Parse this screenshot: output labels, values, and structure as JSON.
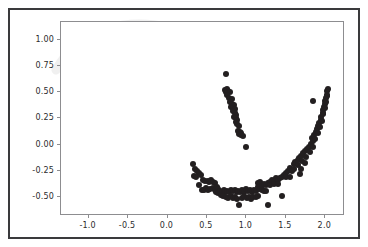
{
  "figure": {
    "background_color": "#ffffff",
    "border_color": "#3a3a3c",
    "axes_edge_color": "#8d8d90",
    "point_color": "#231f20",
    "tick_label_color": "#2b2b2d"
  },
  "chart_data": {
    "type": "scatter",
    "title": "",
    "xlabel": "",
    "ylabel": "",
    "xlim": [
      -1.35,
      2.25
    ],
    "ylim": [
      -0.68,
      1.17
    ],
    "xticks": [
      -1.0,
      -0.5,
      0.0,
      0.5,
      1.0,
      1.5,
      2.0
    ],
    "xtick_labels": [
      "-1.0",
      "-0.5",
      "0.0",
      "0.5",
      "1.0",
      "1.5",
      "2.0"
    ],
    "yticks": [
      1.0,
      0.75,
      0.5,
      0.25,
      0.0,
      -0.25,
      -0.5
    ],
    "ytick_labels": [
      "1.00",
      "0.75",
      "0.50",
      "0.25",
      "0.00",
      "-0.25",
      "-0.50"
    ],
    "grid": false,
    "legend": null,
    "marker": "circle",
    "marker_size": 6,
    "series": [
      {
        "name": "lower-moon",
        "color": "#231f20",
        "points": [
          [
            0.745,
            0.672
          ],
          [
            0.726,
            0.525
          ],
          [
            0.751,
            0.528
          ],
          [
            0.772,
            0.512
          ],
          [
            0.742,
            0.498
          ],
          [
            0.793,
            0.498
          ],
          [
            0.76,
            0.47
          ],
          [
            0.785,
            0.447
          ],
          [
            0.812,
            0.432
          ],
          [
            0.793,
            0.405
          ],
          [
            0.818,
            0.392
          ],
          [
            0.84,
            0.378
          ],
          [
            0.808,
            0.362
          ],
          [
            0.832,
            0.352
          ],
          [
            0.855,
            0.338
          ],
          [
            0.826,
            0.318
          ],
          [
            0.852,
            0.3
          ],
          [
            0.872,
            0.285
          ],
          [
            0.845,
            0.268
          ],
          [
            0.868,
            0.252
          ],
          [
            0.88,
            0.232
          ],
          [
            0.862,
            0.215
          ],
          [
            0.885,
            0.198
          ],
          [
            0.9,
            0.178
          ],
          [
            0.893,
            0.128
          ],
          [
            0.915,
            0.12
          ],
          [
            0.935,
            0.112
          ],
          [
            0.905,
            0.098
          ],
          [
            0.928,
            0.09
          ],
          [
            0.952,
            0.082
          ],
          [
            0.995,
            -0.022
          ],
          [
            0.318,
            -0.188
          ],
          [
            0.352,
            -0.228
          ],
          [
            0.372,
            -0.252
          ],
          [
            0.395,
            -0.268
          ],
          [
            0.338,
            -0.295
          ],
          [
            0.362,
            -0.305
          ],
          [
            0.42,
            -0.292
          ],
          [
            0.455,
            -0.338
          ],
          [
            0.478,
            -0.348
          ],
          [
            0.508,
            -0.345
          ],
          [
            0.53,
            -0.352
          ],
          [
            0.398,
            -0.382
          ],
          [
            0.555,
            -0.338
          ],
          [
            0.578,
            -0.355
          ],
          [
            0.6,
            -0.362
          ],
          [
            0.432,
            -0.428
          ],
          [
            0.46,
            -0.432
          ],
          [
            0.49,
            -0.415
          ],
          [
            0.515,
            -0.432
          ],
          [
            0.545,
            -0.422
          ],
          [
            0.572,
            -0.412
          ],
          [
            0.598,
            -0.432
          ],
          [
            0.622,
            -0.408
          ],
          [
            0.645,
            -0.425
          ],
          [
            0.612,
            -0.455
          ],
          [
            0.638,
            -0.462
          ],
          [
            0.665,
            -0.438
          ],
          [
            0.69,
            -0.448
          ],
          [
            0.712,
            -0.43
          ],
          [
            0.735,
            -0.452
          ],
          [
            0.672,
            -0.478
          ],
          [
            0.7,
            -0.492
          ],
          [
            0.758,
            -0.438
          ],
          [
            0.782,
            -0.452
          ],
          [
            0.805,
            -0.432
          ],
          [
            0.828,
            -0.445
          ],
          [
            0.852,
            -0.428
          ],
          [
            0.745,
            -0.495
          ],
          [
            0.772,
            -0.505
          ],
          [
            0.8,
            -0.488
          ],
          [
            0.875,
            -0.452
          ],
          [
            0.898,
            -0.438
          ],
          [
            0.922,
            -0.455
          ],
          [
            0.828,
            -0.512
          ],
          [
            0.855,
            -0.498
          ],
          [
            0.885,
            -0.518
          ],
          [
            0.908,
            -0.572
          ],
          [
            0.948,
            -0.432
          ],
          [
            0.972,
            -0.448
          ],
          [
            0.998,
            -0.425
          ],
          [
            1.022,
            -0.442
          ],
          [
            1.048,
            -0.428
          ],
          [
            0.945,
            -0.505
          ],
          [
            0.975,
            -0.492
          ],
          [
            1.002,
            -0.512
          ],
          [
            1.072,
            -0.448
          ],
          [
            1.098,
            -0.432
          ],
          [
            1.122,
            -0.442
          ],
          [
            1.035,
            -0.498
          ],
          [
            1.062,
            -0.518
          ],
          [
            1.09,
            -0.502
          ],
          [
            1.148,
            -0.368
          ],
          [
            1.172,
            -0.352
          ],
          [
            1.145,
            -0.408
          ],
          [
            1.17,
            -0.422
          ],
          [
            1.122,
            -0.498
          ],
          [
            1.152,
            -0.485
          ],
          [
            1.198,
            -0.392
          ],
          [
            1.222,
            -0.372
          ],
          [
            1.198,
            -0.432
          ],
          [
            1.225,
            -0.442
          ],
          [
            1.25,
            -0.388
          ],
          [
            1.275,
            -0.368
          ],
          [
            1.248,
            -0.438
          ],
          [
            1.272,
            -0.575
          ],
          [
            1.3,
            -0.352
          ],
          [
            1.325,
            -0.332
          ],
          [
            1.302,
            -0.388
          ],
          [
            1.348,
            -0.342
          ],
          [
            1.372,
            -0.322
          ],
          [
            1.355,
            -0.375
          ],
          [
            1.398,
            -0.335
          ],
          [
            1.422,
            -0.318
          ],
          [
            1.4,
            -0.372
          ],
          [
            1.448,
            -0.305
          ],
          [
            1.472,
            -0.288
          ],
          [
            1.455,
            -0.485
          ],
          [
            1.498,
            -0.268
          ],
          [
            1.522,
            -0.248
          ],
          [
            1.502,
            -0.308
          ],
          [
            1.548,
            -0.222
          ],
          [
            1.572,
            -0.252
          ],
          [
            1.552,
            -0.312
          ],
          [
            1.598,
            -0.188
          ],
          [
            1.622,
            -0.165
          ],
          [
            1.602,
            -0.228
          ],
          [
            1.648,
            -0.148
          ],
          [
            1.672,
            -0.125
          ],
          [
            1.652,
            -0.198
          ],
          [
            1.68,
            -0.278
          ],
          [
            1.698,
            -0.105
          ],
          [
            1.722,
            -0.082
          ],
          [
            1.702,
            -0.158
          ],
          [
            1.748,
            -0.062
          ],
          [
            1.772,
            -0.042
          ],
          [
            1.752,
            -0.118
          ],
          [
            1.798,
            -0.018
          ],
          [
            1.822,
            0.008
          ],
          [
            1.802,
            -0.072
          ],
          [
            1.842,
            0.038
          ],
          [
            1.832,
            0.062
          ],
          [
            1.848,
            -0.022
          ],
          [
            1.862,
            0.092
          ],
          [
            1.882,
            0.118
          ],
          [
            1.872,
            0.058
          ],
          [
            1.895,
            0.148
          ],
          [
            1.912,
            0.178
          ],
          [
            1.902,
            0.112
          ],
          [
            1.925,
            0.208
          ],
          [
            1.942,
            0.238
          ],
          [
            1.932,
            0.168
          ],
          [
            1.952,
            0.268
          ],
          [
            1.965,
            0.298
          ],
          [
            1.955,
            0.228
          ],
          [
            1.972,
            0.328
          ],
          [
            1.985,
            0.358
          ],
          [
            1.975,
            0.288
          ],
          [
            1.992,
            0.388
          ],
          [
            2.002,
            0.418
          ],
          [
            1.995,
            0.348
          ],
          [
            2.01,
            0.448
          ],
          [
            2.018,
            0.478
          ],
          [
            2.008,
            0.408
          ],
          [
            2.022,
            0.512
          ],
          [
            2.032,
            0.532
          ],
          [
            2.018,
            0.468
          ],
          [
            1.838,
            0.418
          ],
          [
            1.698,
            -0.232
          ],
          [
            1.738,
            -0.178
          ]
        ]
      }
    ]
  }
}
